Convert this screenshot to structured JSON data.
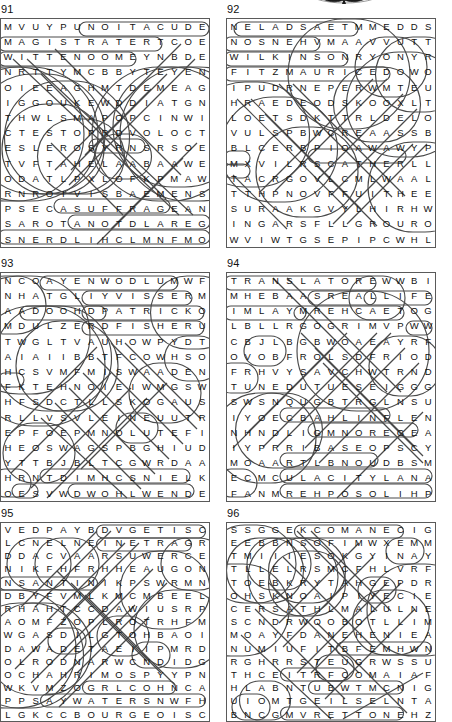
{
  "page": {
    "decoration": "partial-bat-graphic",
    "ink_color": "#4a4a4a",
    "border_color": "#5a5a5a",
    "text_color": "#111111"
  },
  "puzzles": [
    {
      "number": "91",
      "cols": 16,
      "rows": 16,
      "rect": {
        "x": 6,
        "y": 18,
        "w": 208,
        "h": 228
      },
      "rows_letters": [
        "MVUYPUNOITACUDE",
        "MAGISTRATERTCOE",
        "WITTENOOMEYNBDE",
        "NRTTYMCBBYTEYEN",
        "OIEEAGHMTDEMEAG",
        "IGGOUKEWDDIATGN",
        "THWLSMAPOPCINWI",
        "CTESTOPRDVOLOCT",
        "ESLEROSYRNSRSOE",
        "TVFTAHELAABAAWE",
        "ODATLPXLOFKPMAW",
        "RNROIVISBAEMENS",
        "PSECASUFFRAGEAN",
        "SAROTANOTDLAREG",
        "SNERDLIHCLMNFMO"
      ]
    },
    {
      "number": "92",
      "cols": 16,
      "rows": 16,
      "rect": {
        "x": 232,
        "y": 18,
        "w": 208,
        "h": 228
      },
      "rows_letters": [
        "NELADSAETMMEDDS",
        "NOSNEHVMAAVVUTT",
        "WILKINSONRYONYR",
        "FITZMAURICEDOWO",
        "IPUDRNEPERWMTEU",
        "HRAEDEODSKOOXLT",
        "LOETSDKTTRLDELO",
        "VULSPBWCREAASSB",
        "BLCERBPIOAWAWYP",
        "MXVILRSCATHERLL",
        "TACRGOVLCMLWAAL",
        "TTHPNOVFFUITHEE",
        "SURAAKGVYLHIRHW",
        "INGARSFLLGROURO",
        "WVIWTGSEPIPCWHL"
      ]
    },
    {
      "number": "93",
      "cols": 16,
      "rows": 16,
      "rect": {
        "x": 6,
        "y": 272,
        "w": 208,
        "h": 228
      },
      "rows_letters": [
        "NCOAYENWODLUMWF",
        "NHATGLIYVISSERM",
        "AADOOHDPATRICKO",
        "MDULZERDFISHERU",
        "TWGLTVAUHOWPYDT",
        "AIAIIBBTFCOWHSO",
        "HCSVMFMISWAADEN",
        "FKTEHNOIEIWMGSW",
        "HFSDCTLLSKOGAUS",
        "RLLVSVLEINEUUTR",
        "EPFOEPMNOLUTEFI",
        "HEOSWAGSPBGHIUD",
        "YTTBJBLTCGWRDAA",
        "HRNTDIMHCSNIELK",
        "OESVWDWOHLWENDE"
      ]
    },
    {
      "number": "94",
      "cols": 16,
      "rows": 16,
      "rect": {
        "x": 232,
        "y": 272,
        "w": 208,
        "h": 228
      },
      "rows_letters": [
        "TRANSLATOREWWBI",
        "MHEBAASREALLIFE",
        "IMLAYMREHCAETOG",
        "LBLLRGOGRIMVPWW",
        "CBJLBGBWOAEAYRF",
        "OVOBFROLSDFRIOD",
        "FRHVYSAVCHWTRND",
        "TUNEDUTUESEIGGG",
        "SWSNQUGBTRGLNSU",
        "IYOECBAHLINFLEN",
        "NHNDLIGMNOREGEA",
        "IYPRRIBASEOPSCY",
        "MOAARTLBNOUDBSM",
        "ECMCULACITYLANA",
        "FANMREHPOSOLIHP"
      ]
    },
    {
      "number": "95",
      "cols": 16,
      "rows": 15,
      "rect": {
        "x": 6,
        "y": 522,
        "w": 208,
        "h": 198
      },
      "rows_letters": [
        "VEDPAYBDVGETISC",
        "LCNELNEINETRAGR",
        "DDACVAARSUWERCE",
        "NIKFHFRHHEAUGON",
        "NSANTINIKPSWRMN",
        "DBYFVMLKMCMBEEL",
        "RHAHTCCDAWIUSRP",
        "AOMFZOPLROTRHFM",
        "WGASDILGTOHBAOI",
        "DAWADETAEIIPMRD",
        "OLRODNARWCNDIDG",
        "OCHAHRIMOSPYYPN",
        "WKVMZOGRLCOHNCA",
        "PPSAYWATERSNWFH",
        "LGKCCBOURGEOISC"
      ]
    },
    {
      "number": "96",
      "cols": 16,
      "rows": 15,
      "rect": {
        "x": 232,
        "y": 522,
        "w": 208,
        "h": 198
      },
      "rows_letters": [
        "SSGGEKCOMANECIG",
        "EEBBNSOFIMWXEMM",
        "TMIIIESOKGYINAY",
        "TLLELRSMCFHLVRF",
        "TOEBKRYTAHGEPDR",
        "OHSKNOAIPIYECIE",
        "CERSATHLMALULNE",
        "SCNDRWOOBOTLLIM",
        "MOAYFDANEHENIEA",
        "NUMIUFITBFEMHWN",
        "RGHRRSTEUGRWSSU",
        "THCEITRFCOMAIAF",
        "HLABNTUBWTMCNIG",
        "UIOMTGEILSELNTA",
        "BNCGMVRETTONEHZ"
      ]
    }
  ]
}
